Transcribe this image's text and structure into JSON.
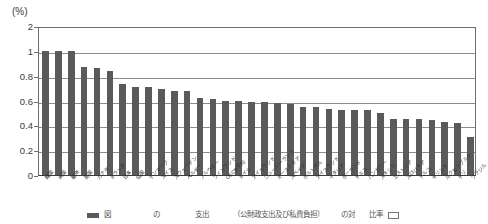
{
  "chart_data": {
    "type": "bar",
    "title": "",
    "subtitle": "",
    "unit_label": "(%)",
    "xlabel": "",
    "ylabel": "",
    "ylim": [
      0,
      2
    ],
    "grid": true,
    "legend_position": "bottom",
    "axis_note": "broken axis: 0 to 1 linear in 0.2 steps, then single step to 2",
    "ytick_labels": [
      "2",
      "1",
      "0.8",
      "0.6",
      "0.4",
      "0.2",
      "0"
    ],
    "ytick_values": [
      2,
      1,
      0.8,
      0.6,
      0.4,
      0.2,
      0
    ],
    "bar_color": "#5a5a5a",
    "categories": [
      "韓国",
      "米国",
      "豪州",
      "英国",
      "カナダ",
      "オランダ",
      "日本",
      "仏国",
      "デンマーク",
      "スイス",
      "スウェーデン",
      "ベルギー",
      "ノルウェー",
      "フィンランド",
      "OECD平均",
      "ドイツ",
      "アイルランド",
      "ニュージーランド",
      "オーストリア",
      "スペイン",
      "ポルトガル",
      "アイスランド",
      "イタリア",
      "ポーランド",
      "チェコ",
      "ハンガリー",
      "メキシコ",
      "エストニア",
      "スロバキア",
      "トルコ",
      "ギリシャ",
      "ルクセンブルク",
      "チリ",
      "ブラジル"
    ],
    "values": [
      1.0,
      1.0,
      1.0,
      0.87,
      0.86,
      0.84,
      0.73,
      0.71,
      0.71,
      0.69,
      0.68,
      0.68,
      0.62,
      0.61,
      0.6,
      0.6,
      0.59,
      0.59,
      0.58,
      0.57,
      0.55,
      0.55,
      0.53,
      0.52,
      0.52,
      0.52,
      0.5,
      0.45,
      0.45,
      0.45,
      0.44,
      0.43,
      0.42,
      0.31
    ]
  },
  "caption": {
    "text": "図     　　　 　　 の　　　　　支出　　　　（公財政支出及び私費負担）　　　の対　　比率"
  }
}
